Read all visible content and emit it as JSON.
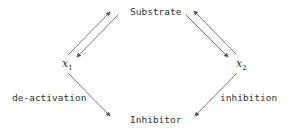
{
  "diagram": {
    "nodes": {
      "substrate": "Substrate",
      "inhibitor": "Inhibitor",
      "x1": {
        "base": "x",
        "sub": "1"
      },
      "x2": {
        "base": "x",
        "sub": "2"
      }
    },
    "edge_labels": {
      "left": "de-activation",
      "right": "inhibition"
    },
    "edges": [
      {
        "from": "x1",
        "to": "Substrate"
      },
      {
        "from": "Substrate",
        "to": "x1"
      },
      {
        "from": "Substrate",
        "to": "x2"
      },
      {
        "from": "x2",
        "to": "Substrate"
      },
      {
        "from": "x1",
        "to": "Inhibitor",
        "label": "de-activation"
      },
      {
        "from": "x2",
        "to": "Inhibitor",
        "label": "inhibition"
      }
    ],
    "colors": {
      "line": "#555555",
      "text": "#333333",
      "background": "#ffffff"
    }
  }
}
